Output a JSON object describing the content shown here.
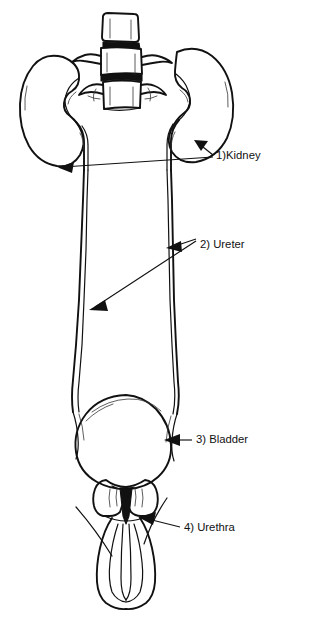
{
  "diagram": {
    "style": "black and white line drawing",
    "background_color": "#ffffff",
    "line_color": "#111111",
    "width": 309,
    "height": 627
  },
  "labels": [
    {
      "id": "kidney",
      "number": "1",
      "text": "1)Kidney",
      "x": 216,
      "y": 156,
      "target": "kidney-pair"
    },
    {
      "id": "ureter",
      "number": "2",
      "text": "2) Ureter",
      "x": 200,
      "y": 245,
      "target": "ureter-pair"
    },
    {
      "id": "bladder",
      "number": "3",
      "text": "3) Bladder",
      "x": 196,
      "y": 440,
      "target": "urinary-bladder"
    },
    {
      "id": "urethra",
      "number": "4",
      "text": "4) Urethra",
      "x": 184,
      "y": 528,
      "target": "urethra-canal"
    }
  ],
  "structures": [
    {
      "id": "vertebrae",
      "name": "lumbar vertebrae",
      "count": 3
    },
    {
      "id": "kidney-left",
      "name": "left kidney"
    },
    {
      "id": "kidney-right",
      "name": "right kidney"
    },
    {
      "id": "ureter-left",
      "name": "left ureter"
    },
    {
      "id": "ureter-right",
      "name": "right ureter"
    },
    {
      "id": "urinary-bladder",
      "name": "urinary bladder"
    },
    {
      "id": "prostate",
      "name": "prostate gland"
    },
    {
      "id": "penis",
      "name": "penis"
    },
    {
      "id": "urethra-canal",
      "name": "urethra"
    }
  ]
}
